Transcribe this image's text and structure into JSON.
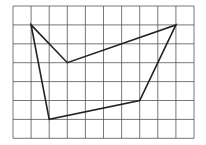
{
  "diagram": {
    "type": "grid-polygon",
    "grid": {
      "columns": 10,
      "rows": 7,
      "origin_px": [
        13,
        6
      ],
      "cell_width_px": 18.1,
      "cell_height_px": 18.9,
      "line_color": "#555555"
    },
    "polygon": {
      "stroke_color": "#222222",
      "vertices": [
        [
          1,
          1
        ],
        [
          3,
          3
        ],
        [
          9,
          1
        ],
        [
          7,
          5
        ],
        [
          2,
          6
        ]
      ]
    }
  }
}
